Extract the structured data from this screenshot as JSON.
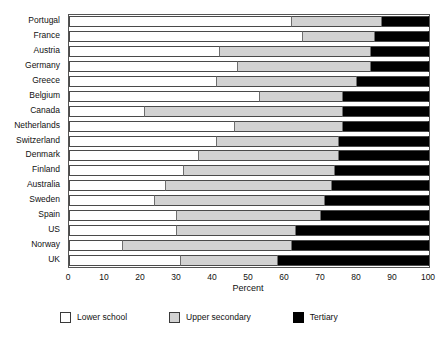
{
  "chart_data": {
    "type": "bar",
    "orientation": "horizontal",
    "stacked": true,
    "title": "",
    "xlabel": "Percent",
    "ylabel": "",
    "xlim": [
      0,
      100
    ],
    "xticks": [
      0,
      10,
      20,
      30,
      40,
      50,
      60,
      70,
      80,
      90,
      100
    ],
    "grid": false,
    "legend_position": "bottom",
    "categories": [
      "Portugal",
      "France",
      "Austria",
      "Germany",
      "Greece",
      "Belgium",
      "Canada",
      "Netherlands",
      "Switzerland",
      "Denmark",
      "Finland",
      "Australia",
      "Sweden",
      "Spain",
      "US",
      "Norway",
      "UK"
    ],
    "series": [
      {
        "name": "Lower school",
        "color": "#ffffff",
        "values": [
          62,
          65,
          42,
          47,
          41,
          53,
          21,
          46,
          41,
          36,
          32,
          27,
          24,
          30,
          30,
          15,
          31
        ]
      },
      {
        "name": "Upper secondary",
        "color": "#d2d2d2",
        "values": [
          25,
          20,
          42,
          37,
          39,
          23,
          55,
          30,
          34,
          39,
          42,
          46,
          47,
          40,
          33,
          47,
          27
        ]
      },
      {
        "name": "Tertiary",
        "color": "#000000",
        "values": [
          13,
          15,
          16,
          16,
          20,
          24,
          24,
          24,
          25,
          25,
          26,
          27,
          29,
          30,
          37,
          38,
          42
        ]
      }
    ]
  },
  "legend": {
    "items": [
      {
        "label": "Lower school"
      },
      {
        "label": "Upper secondary"
      },
      {
        "label": "Tertiary"
      }
    ]
  }
}
